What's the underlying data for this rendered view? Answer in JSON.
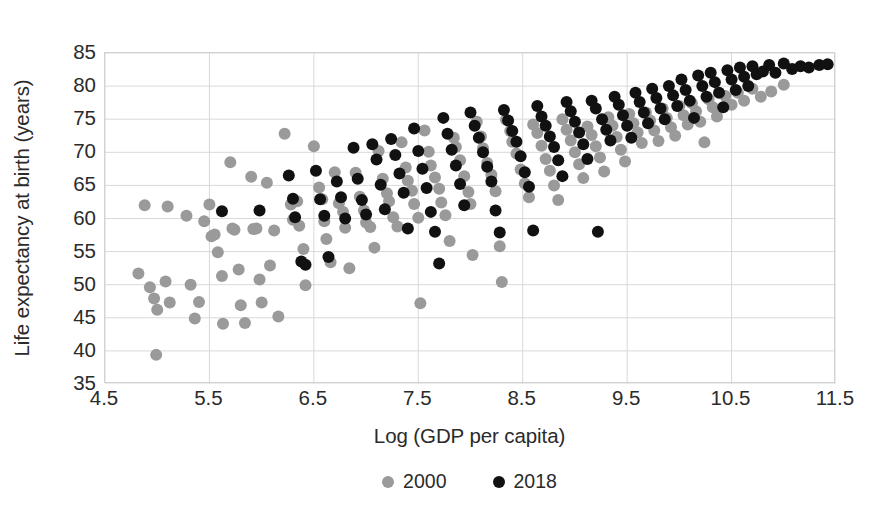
{
  "chart_data": {
    "type": "scatter",
    "title": "",
    "xlabel": "Log (GDP per capita)",
    "ylabel": "Life expectancy at birth (years)",
    "xlim": [
      4.5,
      11.5
    ],
    "ylim": [
      35,
      85
    ],
    "xticks": [
      "4.5",
      "5.5",
      "6.5",
      "7.5",
      "8.5",
      "9.5",
      "10.5",
      "11.5"
    ],
    "xtick_values": [
      4.5,
      5.5,
      6.5,
      7.5,
      8.5,
      9.5,
      10.5,
      11.5
    ],
    "yticks": [
      "35",
      "40",
      "45",
      "50",
      "55",
      "60",
      "65",
      "70",
      "75",
      "80",
      "85"
    ],
    "ytick_values": [
      35,
      40,
      45,
      50,
      55,
      60,
      65,
      70,
      75,
      80,
      85
    ],
    "grid": true,
    "legend_position": "bottom-center",
    "colors": {
      "series_2000": "#9a9a9a",
      "series_2018": "#111111",
      "grid": "#d9d9d9",
      "axis": "#cfcfcf"
    },
    "marker_diameter_px": 12,
    "series": [
      {
        "name": "2000",
        "color": "#9a9a9a",
        "points": [
          [
            4.82,
            51.7
          ],
          [
            4.88,
            62.0
          ],
          [
            4.93,
            49.6
          ],
          [
            4.97,
            47.9
          ],
          [
            5.0,
            46.2
          ],
          [
            4.99,
            39.4
          ],
          [
            5.08,
            50.5
          ],
          [
            5.12,
            47.3
          ],
          [
            5.1,
            61.8
          ],
          [
            5.28,
            60.4
          ],
          [
            5.32,
            50.0
          ],
          [
            5.36,
            44.9
          ],
          [
            5.4,
            47.4
          ],
          [
            5.45,
            59.6
          ],
          [
            5.5,
            62.1
          ],
          [
            5.52,
            57.3
          ],
          [
            5.55,
            57.6
          ],
          [
            5.58,
            54.9
          ],
          [
            5.62,
            51.3
          ],
          [
            5.63,
            44.1
          ],
          [
            5.7,
            68.5
          ],
          [
            5.72,
            58.5
          ],
          [
            5.74,
            58.3
          ],
          [
            5.78,
            52.3
          ],
          [
            5.8,
            46.9
          ],
          [
            5.84,
            44.2
          ],
          [
            5.9,
            66.3
          ],
          [
            5.92,
            58.4
          ],
          [
            5.95,
            58.5
          ],
          [
            5.98,
            50.8
          ],
          [
            6.0,
            47.3
          ],
          [
            6.05,
            65.4
          ],
          [
            6.08,
            52.9
          ],
          [
            6.12,
            58.2
          ],
          [
            6.16,
            45.2
          ],
          [
            6.22,
            72.8
          ],
          [
            6.28,
            62.1
          ],
          [
            6.3,
            59.8
          ],
          [
            6.34,
            62.6
          ],
          [
            6.36,
            58.9
          ],
          [
            6.4,
            55.4
          ],
          [
            6.42,
            49.9
          ],
          [
            6.5,
            70.9
          ],
          [
            6.55,
            64.7
          ],
          [
            6.58,
            62.9
          ],
          [
            6.6,
            59.6
          ],
          [
            6.62,
            56.9
          ],
          [
            6.66,
            53.4
          ],
          [
            6.7,
            67.0
          ],
          [
            6.74,
            62.3
          ],
          [
            6.78,
            61.0
          ],
          [
            6.8,
            58.6
          ],
          [
            6.84,
            52.5
          ],
          [
            6.9,
            66.9
          ],
          [
            6.94,
            63.3
          ],
          [
            6.98,
            61.2
          ],
          [
            7.0,
            59.4
          ],
          [
            7.04,
            58.7
          ],
          [
            7.08,
            55.6
          ],
          [
            7.12,
            70.2
          ],
          [
            7.16,
            66.0
          ],
          [
            7.2,
            63.8
          ],
          [
            7.22,
            62.6
          ],
          [
            7.26,
            60.2
          ],
          [
            7.3,
            58.8
          ],
          [
            7.34,
            71.5
          ],
          [
            7.38,
            67.7
          ],
          [
            7.4,
            65.7
          ],
          [
            7.44,
            64.2
          ],
          [
            7.46,
            62.2
          ],
          [
            7.5,
            60.1
          ],
          [
            7.52,
            47.2
          ],
          [
            7.56,
            73.3
          ],
          [
            7.6,
            70.1
          ],
          [
            7.62,
            68.0
          ],
          [
            7.66,
            66.2
          ],
          [
            7.7,
            64.5
          ],
          [
            7.72,
            62.4
          ],
          [
            7.76,
            60.5
          ],
          [
            7.8,
            56.6
          ],
          [
            7.84,
            72.2
          ],
          [
            7.86,
            70.8
          ],
          [
            7.9,
            68.8
          ],
          [
            7.94,
            66.4
          ],
          [
            7.98,
            64.0
          ],
          [
            8.0,
            62.2
          ],
          [
            8.02,
            54.5
          ],
          [
            8.06,
            74.6
          ],
          [
            8.1,
            72.4
          ],
          [
            8.12,
            70.6
          ],
          [
            8.16,
            68.4
          ],
          [
            8.2,
            66.6
          ],
          [
            8.24,
            64.1
          ],
          [
            8.28,
            55.8
          ],
          [
            8.3,
            50.4
          ],
          [
            8.34,
            74.9
          ],
          [
            8.38,
            73.2
          ],
          [
            8.4,
            71.6
          ],
          [
            8.44,
            69.8
          ],
          [
            8.48,
            67.4
          ],
          [
            8.52,
            65.3
          ],
          [
            8.56,
            63.2
          ],
          [
            8.6,
            74.2
          ],
          [
            8.64,
            72.9
          ],
          [
            8.68,
            71.0
          ],
          [
            8.72,
            69.0
          ],
          [
            8.76,
            67.2
          ],
          [
            8.8,
            65.0
          ],
          [
            8.84,
            62.8
          ],
          [
            8.88,
            75.0
          ],
          [
            8.92,
            73.4
          ],
          [
            8.96,
            71.8
          ],
          [
            9.0,
            70.0
          ],
          [
            9.04,
            68.2
          ],
          [
            9.08,
            66.1
          ],
          [
            9.12,
            73.9
          ],
          [
            9.16,
            72.6
          ],
          [
            9.2,
            70.9
          ],
          [
            9.24,
            69.2
          ],
          [
            9.28,
            67.1
          ],
          [
            9.32,
            75.3
          ],
          [
            9.36,
            74.0
          ],
          [
            9.4,
            72.3
          ],
          [
            9.44,
            70.4
          ],
          [
            9.48,
            68.6
          ],
          [
            9.52,
            75.8
          ],
          [
            9.56,
            74.4
          ],
          [
            9.6,
            73.0
          ],
          [
            9.64,
            71.4
          ],
          [
            9.68,
            76.0
          ],
          [
            9.72,
            74.8
          ],
          [
            9.76,
            73.3
          ],
          [
            9.8,
            71.7
          ],
          [
            9.84,
            76.6
          ],
          [
            9.88,
            75.2
          ],
          [
            9.92,
            73.8
          ],
          [
            9.96,
            72.5
          ],
          [
            10.0,
            77.0
          ],
          [
            10.04,
            75.6
          ],
          [
            10.08,
            74.2
          ],
          [
            10.12,
            77.4
          ],
          [
            10.16,
            76.2
          ],
          [
            10.2,
            74.6
          ],
          [
            10.24,
            71.5
          ],
          [
            10.28,
            78.0
          ],
          [
            10.32,
            76.8
          ],
          [
            10.36,
            75.4
          ],
          [
            10.44,
            78.5
          ],
          [
            10.5,
            77.2
          ],
          [
            10.56,
            79.0
          ],
          [
            10.62,
            77.8
          ],
          [
            10.7,
            79.6
          ],
          [
            10.78,
            78.4
          ],
          [
            10.88,
            79.2
          ],
          [
            11.0,
            80.2
          ]
        ]
      },
      {
        "name": "2018",
        "color": "#111111",
        "points": [
          [
            5.62,
            61.1
          ],
          [
            5.98,
            61.2
          ],
          [
            6.26,
            66.5
          ],
          [
            6.3,
            63.0
          ],
          [
            6.32,
            60.2
          ],
          [
            6.38,
            53.5
          ],
          [
            6.42,
            53.0
          ],
          [
            6.52,
            67.2
          ],
          [
            6.56,
            62.9
          ],
          [
            6.6,
            60.4
          ],
          [
            6.64,
            54.2
          ],
          [
            6.72,
            65.6
          ],
          [
            6.76,
            63.2
          ],
          [
            6.8,
            60.0
          ],
          [
            6.88,
            70.7
          ],
          [
            6.92,
            66.0
          ],
          [
            6.96,
            62.8
          ],
          [
            7.0,
            60.6
          ],
          [
            7.06,
            71.2
          ],
          [
            7.1,
            68.9
          ],
          [
            7.14,
            65.1
          ],
          [
            7.18,
            61.4
          ],
          [
            7.24,
            72.0
          ],
          [
            7.28,
            69.6
          ],
          [
            7.32,
            66.8
          ],
          [
            7.36,
            63.9
          ],
          [
            7.4,
            58.5
          ],
          [
            7.46,
            73.6
          ],
          [
            7.5,
            70.2
          ],
          [
            7.54,
            67.5
          ],
          [
            7.58,
            64.6
          ],
          [
            7.62,
            61.0
          ],
          [
            7.66,
            58.0
          ],
          [
            7.7,
            53.2
          ],
          [
            7.74,
            75.2
          ],
          [
            7.78,
            72.8
          ],
          [
            7.82,
            70.4
          ],
          [
            7.86,
            68.0
          ],
          [
            7.9,
            65.2
          ],
          [
            7.94,
            62.0
          ],
          [
            8.0,
            76.0
          ],
          [
            8.04,
            74.0
          ],
          [
            8.08,
            72.2
          ],
          [
            8.12,
            70.0
          ],
          [
            8.16,
            67.8
          ],
          [
            8.2,
            65.6
          ],
          [
            8.24,
            61.2
          ],
          [
            8.28,
            57.9
          ],
          [
            8.32,
            76.4
          ],
          [
            8.36,
            74.8
          ],
          [
            8.4,
            73.2
          ],
          [
            8.44,
            71.6
          ],
          [
            8.48,
            69.4
          ],
          [
            8.52,
            67.0
          ],
          [
            8.56,
            64.8
          ],
          [
            8.6,
            58.2
          ],
          [
            8.64,
            77.0
          ],
          [
            8.68,
            75.4
          ],
          [
            8.72,
            74.0
          ],
          [
            8.76,
            72.4
          ],
          [
            8.8,
            70.8
          ],
          [
            8.84,
            68.8
          ],
          [
            8.88,
            66.4
          ],
          [
            8.92,
            77.6
          ],
          [
            8.96,
            76.2
          ],
          [
            9.0,
            74.6
          ],
          [
            9.04,
            73.0
          ],
          [
            9.08,
            71.2
          ],
          [
            9.12,
            69.0
          ],
          [
            9.16,
            77.8
          ],
          [
            9.2,
            76.6
          ],
          [
            9.22,
            58.0
          ],
          [
            9.26,
            75.0
          ],
          [
            9.3,
            73.4
          ],
          [
            9.34,
            71.8
          ],
          [
            9.38,
            78.4
          ],
          [
            9.42,
            77.2
          ],
          [
            9.46,
            75.6
          ],
          [
            9.5,
            74.0
          ],
          [
            9.54,
            72.2
          ],
          [
            9.58,
            79.0
          ],
          [
            9.62,
            77.6
          ],
          [
            9.66,
            76.0
          ],
          [
            9.7,
            74.4
          ],
          [
            9.74,
            79.6
          ],
          [
            9.78,
            78.2
          ],
          [
            9.82,
            76.6
          ],
          [
            9.86,
            75.0
          ],
          [
            9.9,
            80.0
          ],
          [
            9.94,
            78.6
          ],
          [
            9.98,
            77.0
          ],
          [
            10.02,
            81.0
          ],
          [
            10.06,
            79.4
          ],
          [
            10.1,
            77.8
          ],
          [
            10.14,
            75.2
          ],
          [
            10.18,
            81.6
          ],
          [
            10.22,
            80.0
          ],
          [
            10.26,
            78.4
          ],
          [
            10.3,
            82.0
          ],
          [
            10.34,
            80.6
          ],
          [
            10.38,
            79.0
          ],
          [
            10.42,
            76.8
          ],
          [
            10.46,
            82.4
          ],
          [
            10.5,
            81.0
          ],
          [
            10.54,
            79.4
          ],
          [
            10.58,
            82.8
          ],
          [
            10.62,
            81.4
          ],
          [
            10.66,
            80.0
          ],
          [
            10.7,
            83.0
          ],
          [
            10.74,
            81.8
          ],
          [
            10.8,
            82.2
          ],
          [
            10.86,
            83.2
          ],
          [
            10.92,
            82.0
          ],
          [
            11.0,
            83.4
          ],
          [
            11.08,
            82.6
          ],
          [
            11.16,
            83.0
          ],
          [
            11.24,
            82.8
          ],
          [
            11.34,
            83.2
          ],
          [
            11.42,
            83.3
          ]
        ]
      }
    ]
  },
  "axes": {
    "y_title": "Life expectancy at birth (years)",
    "x_title": "Log (GDP per capita)",
    "y_tick_labels": [
      "85",
      "80",
      "75",
      "70",
      "65",
      "60",
      "55",
      "50",
      "45",
      "40",
      "35"
    ],
    "x_tick_labels": [
      "4.5",
      "5.5",
      "6.5",
      "7.5",
      "8.5",
      "9.5",
      "10.5",
      "11.5"
    ]
  },
  "legend": {
    "items": [
      {
        "label": "2000",
        "color": "#9a9a9a"
      },
      {
        "label": "2018",
        "color": "#111111"
      }
    ]
  }
}
